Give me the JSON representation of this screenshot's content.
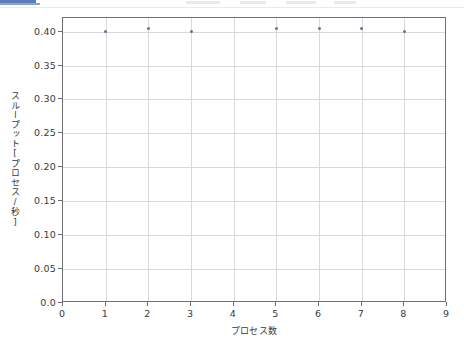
{
  "chrome": {
    "active_tab_accent": "#5b7cba"
  },
  "chart_data": {
    "type": "scatter",
    "title": "",
    "xlabel": "プロセス数",
    "ylabel": "スループット[プロセス/秒]",
    "xlim": [
      0,
      9
    ],
    "ylim": [
      0.0,
      0.42
    ],
    "grid": true,
    "legend": "none",
    "marker_color": "#6a6f96",
    "x": [
      1,
      2,
      3,
      5,
      6,
      7,
      8
    ],
    "values": [
      0.4,
      0.405,
      0.4,
      0.404,
      0.404,
      0.405,
      0.4
    ],
    "points": [
      {
        "x": 1,
        "y": 0.4
      },
      {
        "x": 2,
        "y": 0.405
      },
      {
        "x": 3,
        "y": 0.4
      },
      {
        "x": 5,
        "y": 0.404
      },
      {
        "x": 6,
        "y": 0.404
      },
      {
        "x": 7,
        "y": 0.405
      },
      {
        "x": 8,
        "y": 0.4
      }
    ],
    "xticks": [
      "0",
      "1",
      "2",
      "3",
      "4",
      "5",
      "6",
      "7",
      "8",
      "9"
    ],
    "xtick_values": [
      0,
      1,
      2,
      3,
      4,
      5,
      6,
      7,
      8,
      9
    ],
    "yticks": [
      "0.0",
      "0.05",
      "0.10",
      "0.15",
      "0.20",
      "0.25",
      "0.30",
      "0.35",
      "0.40"
    ],
    "ytick_values": [
      0.0,
      0.05,
      0.1,
      0.15,
      0.2,
      0.25,
      0.3,
      0.35,
      0.4
    ]
  }
}
